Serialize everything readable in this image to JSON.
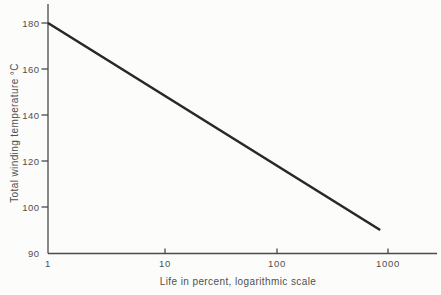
{
  "chart_data": {
    "type": "line",
    "title": "",
    "xlabel": "Life in percent, logarithmic scale",
    "ylabel": "Total winding temperature °C",
    "x_scale": "log",
    "x_ticks": [
      "1",
      "10",
      "100",
      "1000"
    ],
    "y_ticks": [
      "180",
      "160",
      "140",
      "120",
      "100",
      "90"
    ],
    "x_range": [
      1,
      1000
    ],
    "y_range": [
      90,
      185
    ],
    "grid": "off",
    "legend": "none",
    "series": [
      {
        "name": "total winding temperature vs life",
        "points": [
          {
            "x": 1,
            "y": 180
          },
          {
            "x": 850,
            "y": 95
          }
        ]
      }
    ],
    "colors": {
      "line": "#282828",
      "axis": "#4a4a4a",
      "text": "#4f4f4f",
      "background": "#fcfcfb"
    }
  }
}
